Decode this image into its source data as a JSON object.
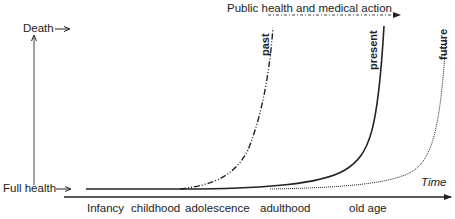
{
  "diagram": {
    "y_axis": {
      "top_label": "Death",
      "bottom_label": "Full health"
    },
    "x_axis": {
      "label": "Time",
      "stages": [
        "Infancy",
        "childhood",
        "adolescence",
        "adulthood",
        "old age"
      ]
    },
    "action_arrow_label": "Public health and medical action",
    "curves": [
      {
        "name": "past",
        "style": "dash-dot-dot"
      },
      {
        "name": "present",
        "style": "solid"
      },
      {
        "name": "future",
        "style": "dotted"
      }
    ]
  }
}
